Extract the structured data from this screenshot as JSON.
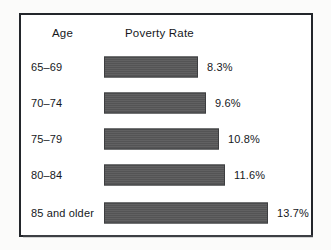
{
  "chart_data": {
    "type": "bar",
    "title": "",
    "orientation": "horizontal",
    "xlabel": "",
    "ylabel": "",
    "grid": false,
    "legend": null,
    "column_headers": {
      "category": "Age",
      "value": "Poverty Rate"
    },
    "categories": [
      "65–69",
      "70–74",
      "75–79",
      "80–84",
      "85 and older"
    ],
    "values": [
      8.3,
      9.6,
      10.8,
      11.6,
      13.7
    ],
    "value_labels": [
      "8.3%",
      "9.6%",
      "10.8%",
      "11.6%",
      "13.7%"
    ],
    "unit": "%",
    "xlim": [
      0,
      13.7
    ],
    "colors": {
      "bar_fill": "#585859",
      "bar_border": "#3d3e40",
      "frame": "#23262b",
      "text": "#16181c",
      "background": "#ffffff"
    }
  },
  "rows": [
    {
      "label": "65–69",
      "value_label": "8.3%",
      "bar_width_px": 94,
      "top_px": 0
    },
    {
      "label": "70–74",
      "value_label": "9.6%",
      "bar_width_px": 102,
      "top_px": 36
    },
    {
      "label": "75–79",
      "value_label": "10.8%",
      "bar_width_px": 115,
      "top_px": 72
    },
    {
      "label": "80–84",
      "value_label": "11.6%",
      "bar_width_px": 121,
      "top_px": 108
    },
    {
      "label": "85 and older",
      "value_label": "13.7%",
      "bar_width_px": 164,
      "top_px": 146
    }
  ]
}
